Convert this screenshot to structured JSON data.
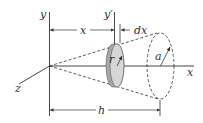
{
  "figure": {
    "type": "geometry-diagram",
    "labels": {
      "y_axis": "y",
      "y_prime_axis": "y′",
      "x_axis": "x",
      "z_axis": "z",
      "x_dim": "x",
      "dx_dim": "dx",
      "h_dim": "h",
      "disk_radius": "r",
      "base_radius": "a"
    },
    "colors": {
      "line": "#333333",
      "disk_face": "#d4d4d4",
      "disk_side": "#a8a8a8"
    }
  }
}
